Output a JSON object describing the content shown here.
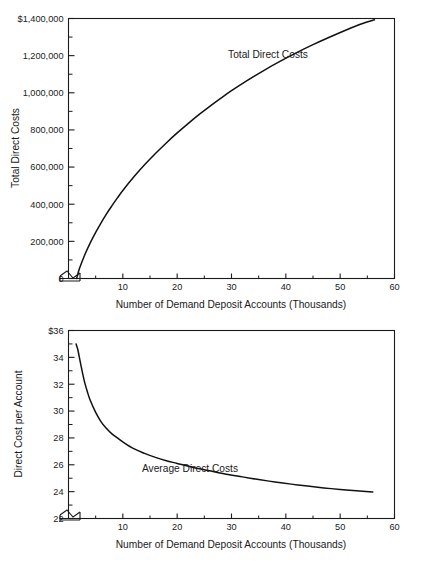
{
  "figure": {
    "title_faint": "",
    "background": "#ffffff",
    "ink": "#1a1a1a"
  },
  "chart_data": [
    {
      "id": "total-direct-costs",
      "type": "line",
      "title": "",
      "xlabel": "Number of Demand Deposit Accounts (Thousands)",
      "ylabel": "Total Direct Costs",
      "series_label": "Total Direct Costs",
      "xlim": [
        0,
        60
      ],
      "ylim": [
        0,
        1400000
      ],
      "xticks": [
        10,
        20,
        30,
        40,
        50,
        60
      ],
      "xtick_labels": [
        "10",
        "20",
        "30",
        "40",
        "50",
        "60"
      ],
      "xminor_ticks": [
        5,
        15,
        25,
        35,
        45,
        55
      ],
      "yticks": [
        0,
        200000,
        400000,
        600000,
        800000,
        1000000,
        1200000,
        1400000
      ],
      "ytick_labels": [
        "0",
        "200,000",
        "400,000",
        "600,000",
        "800,000",
        "1,000,000",
        "1,200,000",
        "$1,400,000"
      ],
      "yminor_ticks": [
        100000,
        300000,
        500000,
        700000,
        900000,
        1100000,
        1300000
      ],
      "axis_break": true,
      "grid": false,
      "legend": "inline-annotation",
      "x": [
        1.5,
        2,
        3,
        4,
        5,
        6,
        7,
        8,
        9,
        10,
        12,
        14,
        16,
        18,
        20,
        22,
        24,
        26,
        28,
        30,
        33,
        36,
        39,
        42,
        45,
        48,
        51,
        54,
        56.3
      ],
      "values": [
        0,
        52000,
        128000,
        192000,
        248000,
        300000,
        348000,
        392000,
        434000,
        474000,
        546000,
        612000,
        673000,
        730000,
        784000,
        834000,
        882000,
        927000,
        970000,
        1011000,
        1068000,
        1121000,
        1170000,
        1216000,
        1259000,
        1299000,
        1337000,
        1372000,
        1393000
      ]
    },
    {
      "id": "average-direct-costs",
      "type": "line",
      "title": "",
      "xlabel": "Number of Demand Deposit Accounts (Thousands)",
      "ylabel": "Direct Cost per Account",
      "series_label": "Average Direct Costs",
      "xlim": [
        0,
        60
      ],
      "ylim": [
        22,
        36
      ],
      "xticks": [
        10,
        20,
        30,
        40,
        50,
        60
      ],
      "xtick_labels": [
        "10",
        "20",
        "30",
        "40",
        "50",
        "60"
      ],
      "xminor_ticks": [
        5,
        15,
        25,
        35,
        45,
        55
      ],
      "yticks": [
        22,
        24,
        26,
        28,
        30,
        32,
        34,
        36
      ],
      "ytick_labels": [
        "22",
        "24",
        "26",
        "28",
        "30",
        "32",
        "34",
        "$36"
      ],
      "yminor_ticks": [
        23,
        25,
        27,
        29,
        31,
        33,
        35
      ],
      "axis_break": true,
      "grid": false,
      "legend": "inline-annotation",
      "x": [
        1.4,
        1.7,
        2,
        2.5,
        3,
        3.5,
        4,
        5,
        6,
        7,
        8,
        9,
        10,
        12,
        14,
        16,
        18,
        20,
        23,
        26,
        29,
        32,
        35,
        38,
        41,
        44,
        47,
        50,
        53,
        56
      ],
      "values": [
        35.0,
        34.6,
        34.0,
        33.0,
        32.1,
        31.4,
        30.8,
        29.9,
        29.2,
        28.7,
        28.3,
        28.0,
        27.7,
        27.2,
        26.85,
        26.55,
        26.3,
        26.1,
        25.8,
        25.55,
        25.3,
        25.1,
        24.9,
        24.72,
        24.56,
        24.42,
        24.28,
        24.16,
        24.06,
        23.97
      ]
    }
  ]
}
